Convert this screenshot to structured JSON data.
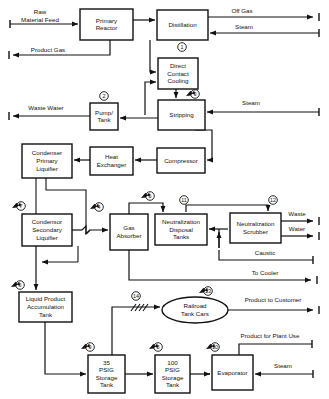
{
  "diagram": {
    "type": "process-flow-diagram",
    "colors": {
      "line": "#111111",
      "box_fill": "#ffffff",
      "background": "#ffffff"
    },
    "nodes": [
      {
        "id": "primary-reactor",
        "label": "Primary\nReactor",
        "shape": "rect",
        "x": 80,
        "y": 9,
        "w": 53,
        "h": 31
      },
      {
        "id": "distillation",
        "label": "Distillation",
        "shape": "rect",
        "x": 157,
        "y": 10,
        "w": 51,
        "h": 30
      },
      {
        "id": "direct-contact-cooling",
        "label": "Direct\nContact\nCooling",
        "shape": "rect",
        "x": 158,
        "y": 58,
        "w": 40,
        "h": 31
      },
      {
        "id": "stripping",
        "label": "Stripping",
        "shape": "rect",
        "x": 158,
        "y": 100,
        "w": 47,
        "h": 30
      },
      {
        "id": "pump-tank",
        "label": "Pump/\nTank",
        "shape": "rect",
        "x": 90,
        "y": 103,
        "w": 28,
        "h": 27
      },
      {
        "id": "condenser-primary",
        "label": "Condenser\nPrimary\nLiquifier",
        "shape": "rect",
        "x": 22,
        "y": 144,
        "w": 50,
        "h": 34
      },
      {
        "id": "heat-exchanger",
        "label": "Heat\nExchanger",
        "shape": "rect",
        "x": 90,
        "y": 147,
        "w": 43,
        "h": 28
      },
      {
        "id": "compressor",
        "label": "Compressor",
        "shape": "rect",
        "x": 157,
        "y": 148,
        "w": 48,
        "h": 25
      },
      {
        "id": "condensor-secondary",
        "label": "Condensor\nSecondary\nLiquifier",
        "shape": "rect",
        "x": 22,
        "y": 214,
        "w": 50,
        "h": 32
      },
      {
        "id": "gas-absorber",
        "label": "Gas\nAbsorber",
        "shape": "rect",
        "x": 110,
        "y": 214,
        "w": 38,
        "h": 36
      },
      {
        "id": "neutralization-disposal-tanks",
        "label": "Neutralization\nDisposal\nTanks",
        "shape": "rect",
        "x": 155,
        "y": 214,
        "w": 52,
        "h": 31
      },
      {
        "id": "neutralization-scrubber",
        "label": "Neutralization\nScrubber",
        "shape": "rect",
        "x": 230,
        "y": 213,
        "w": 51,
        "h": 30
      },
      {
        "id": "liquid-product-accumulation-tank",
        "label": "Liquid Product\nAccumulation\nTank",
        "shape": "rect",
        "x": 19,
        "y": 292,
        "w": 53,
        "h": 30
      },
      {
        "id": "railroad-tank-cars",
        "label": "Railroad\nTank Cars",
        "shape": "ellipse",
        "x": 162,
        "y": 297,
        "w": 66,
        "h": 26
      },
      {
        "id": "storage-tank-35",
        "label": "35\nPSIG\nStorage\nTank",
        "shape": "rect",
        "x": 88,
        "y": 355,
        "w": 37,
        "h": 38
      },
      {
        "id": "storage-tank-100",
        "label": "100\nPSIG\nStorage\nTank",
        "shape": "rect",
        "x": 155,
        "y": 355,
        "w": 35,
        "h": 38
      },
      {
        "id": "evaporator",
        "label": "Evaporator",
        "shape": "rect",
        "x": 212,
        "y": 355,
        "w": 41,
        "h": 35
      }
    ],
    "stream_labels": [
      {
        "id": "raw-material-feed",
        "text": "Raw\nMaterial Feed",
        "x": 40,
        "y": 14
      },
      {
        "id": "product-gas",
        "text": "Product Gas",
        "x": 48,
        "y": 52
      },
      {
        "id": "off-gas",
        "text": "Off Gas",
        "x": 242,
        "y": 13
      },
      {
        "id": "steam-distillation",
        "text": "Steam",
        "x": 244,
        "y": 29
      },
      {
        "id": "waste-water",
        "text": "Waste Water",
        "x": 46,
        "y": 110
      },
      {
        "id": "steam-stripping",
        "text": "Steam",
        "x": 251,
        "y": 105
      },
      {
        "id": "waste",
        "text": "Waste",
        "x": 297,
        "y": 216
      },
      {
        "id": "water",
        "text": "Water",
        "x": 297,
        "y": 231
      },
      {
        "id": "caustic",
        "text": "Caustic",
        "x": 265,
        "y": 255
      },
      {
        "id": "to-cooler",
        "text": "To Cooler",
        "x": 265,
        "y": 275
      },
      {
        "id": "product-to-customer",
        "text": "Product to Customer",
        "x": 273,
        "y": 302
      },
      {
        "id": "product-for-plant-use",
        "text": "Product for Plant Use",
        "x": 270,
        "y": 338
      },
      {
        "id": "steam-evaporator",
        "text": "Steam",
        "x": 283,
        "y": 368
      }
    ],
    "sample_points": [
      {
        "id": "sample-point-1",
        "number": "1",
        "cx": 182,
        "cy": 47,
        "probe": false
      },
      {
        "id": "sample-point-2",
        "number": "2",
        "cx": 104,
        "cy": 96,
        "probe": false
      },
      {
        "id": "sample-point-3",
        "number": "3",
        "cx": 195,
        "cy": 94,
        "probe": true
      },
      {
        "id": "sample-point-4",
        "number": "4",
        "cx": 99,
        "cy": 207,
        "probe": true
      },
      {
        "id": "sample-point-5",
        "number": "5",
        "cx": 150,
        "cy": 196,
        "probe": true
      },
      {
        "id": "sample-point-6",
        "number": "6",
        "cx": 20,
        "cy": 285,
        "probe": true
      },
      {
        "id": "sample-point-7",
        "number": "7",
        "cx": 21,
        "cy": 206,
        "probe": true
      },
      {
        "id": "sample-point-8",
        "number": "8",
        "cx": 158,
        "cy": 347,
        "probe": true
      },
      {
        "id": "sample-point-9",
        "number": "9",
        "cx": 90,
        "cy": 347,
        "probe": true
      },
      {
        "id": "sample-point-10",
        "number": "10",
        "cx": 215,
        "cy": 347,
        "probe": true
      },
      {
        "id": "sample-point-11",
        "number": "11",
        "cx": 184,
        "cy": 200,
        "probe": false
      },
      {
        "id": "sample-point-12",
        "number": "12",
        "cx": 273,
        "cy": 200,
        "probe": false
      },
      {
        "id": "sample-point-13",
        "number": "13",
        "cx": 208,
        "cy": 291,
        "probe": true
      },
      {
        "id": "sample-point-14",
        "number": "14",
        "cx": 136,
        "cy": 296,
        "probe": false
      }
    ]
  }
}
